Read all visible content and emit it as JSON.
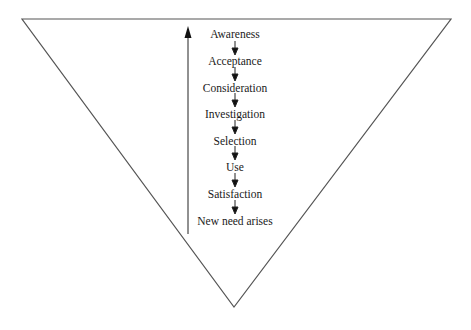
{
  "diagram": {
    "shape": "inverted-triangle",
    "stroke_color": "#555555",
    "stages": [
      {
        "label": "Awareness"
      },
      {
        "label": "Acceptance"
      },
      {
        "label": "Consideration"
      },
      {
        "label": "Investigation"
      },
      {
        "label": "Selection"
      },
      {
        "label": "Use"
      },
      {
        "label": "Satisfaction"
      },
      {
        "label": "New need arises"
      }
    ],
    "feedback_arrow": {
      "direction": "up",
      "from": "New need arises",
      "to": "Awareness"
    }
  }
}
